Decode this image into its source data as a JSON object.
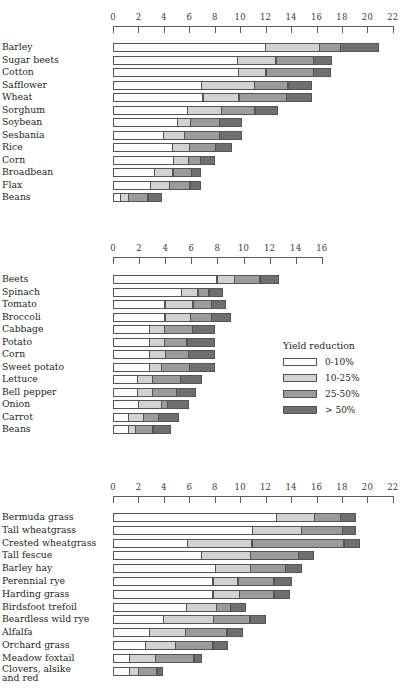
{
  "legend": {
    "title": "Yield reduction",
    "items": [
      {
        "label": "0-10%",
        "color": "#ffffff",
        "class": "s0"
      },
      {
        "label": "10-25%",
        "color": "#d2d2d2",
        "class": "s1"
      },
      {
        "label": "25-50%",
        "color": "#9b9b9b",
        "class": "s2"
      },
      {
        "label": "> 50%",
        "color": "#6f6f6f",
        "class": "s3"
      }
    ]
  },
  "chart_data": [
    {
      "type": "bar",
      "orientation": "horizontal",
      "stacked": true,
      "title": "",
      "xlabel": "",
      "ylabel": "",
      "xlim": [
        0,
        22
      ],
      "xticks": [
        0,
        2,
        4,
        6,
        8,
        10,
        12,
        14,
        16,
        18,
        20,
        22
      ],
      "grid": false,
      "legend_position": "none",
      "series": [
        {
          "name": "0-10%",
          "color": "#ffffff"
        },
        {
          "name": "10-25%",
          "color": "#d2d2d2"
        },
        {
          "name": "25-50%",
          "color": "#9b9b9b"
        },
        {
          "name": "> 50%",
          "color": "#6f6f6f"
        }
      ],
      "categories": [
        "Barley",
        "Sugar beets",
        "Cotton",
        "Safflower",
        "Wheat",
        "Sorghum",
        "Soybean",
        "Sesbania",
        "Rice",
        "Corn",
        "Broadbean",
        "Flax",
        "Beans"
      ],
      "boundaries": [
        [
          0,
          12.0,
          16.3,
          18.0,
          21.1
        ],
        [
          0,
          9.8,
          12.9,
          15.9,
          17.4
        ],
        [
          0,
          9.9,
          12.1,
          15.9,
          17.3
        ],
        [
          0,
          7.0,
          11.2,
          13.9,
          15.8
        ],
        [
          0,
          7.1,
          10.0,
          13.8,
          15.8
        ],
        [
          0,
          5.9,
          8.6,
          11.3,
          13.1
        ],
        [
          0,
          5.1,
          6.2,
          8.5,
          10.3
        ],
        [
          0,
          4.0,
          5.7,
          8.5,
          10.3
        ],
        [
          0,
          4.7,
          6.1,
          8.2,
          9.5
        ],
        [
          0,
          4.8,
          6.0,
          7.0,
          8.2
        ],
        [
          0,
          3.3,
          4.8,
          6.3,
          7.1
        ],
        [
          0,
          3.0,
          4.5,
          6.2,
          7.1
        ],
        [
          0,
          0.6,
          1.3,
          2.9,
          4.0
        ]
      ]
    },
    {
      "type": "bar",
      "orientation": "horizontal",
      "stacked": true,
      "title": "",
      "xlabel": "",
      "ylabel": "",
      "xlim": [
        0,
        16
      ],
      "xticks": [
        0,
        2,
        4,
        6,
        8,
        10,
        12,
        14,
        16
      ],
      "grid": false,
      "legend_position": "right",
      "series": [
        {
          "name": "0-10%",
          "color": "#ffffff"
        },
        {
          "name": "10-25%",
          "color": "#d2d2d2"
        },
        {
          "name": "25-50%",
          "color": "#9b9b9b"
        },
        {
          "name": "> 50%",
          "color": "#6f6f6f"
        }
      ],
      "categories": [
        "Beets",
        "Spinach",
        "Tomato",
        "Broccoli",
        "Cabbage",
        "Potato",
        "Corn",
        "Sweet potato",
        "Lettuce",
        "Bell pepper",
        "Onion",
        "Carrot",
        "Beans"
      ],
      "boundaries": [
        [
          0,
          8.0,
          9.4,
          11.4,
          12.9
        ],
        [
          0,
          5.3,
          6.6,
          7.5,
          8.6
        ],
        [
          0,
          4.0,
          6.2,
          7.7,
          8.8
        ],
        [
          0,
          4.0,
          6.0,
          7.7,
          9.2
        ],
        [
          0,
          2.8,
          4.0,
          6.2,
          8.0
        ],
        [
          0,
          2.8,
          4.0,
          5.8,
          8.0
        ],
        [
          0,
          2.8,
          4.1,
          5.9,
          8.0
        ],
        [
          0,
          2.8,
          3.8,
          6.0,
          8.0
        ],
        [
          0,
          1.9,
          3.1,
          5.3,
          7.0
        ],
        [
          0,
          1.9,
          3.1,
          5.0,
          6.5
        ],
        [
          0,
          2.0,
          3.8,
          4.3,
          6.0
        ],
        [
          0,
          1.2,
          2.4,
          3.6,
          5.2
        ],
        [
          0,
          1.2,
          1.8,
          3.2,
          4.6
        ]
      ]
    },
    {
      "type": "bar",
      "orientation": "horizontal",
      "stacked": true,
      "title": "",
      "xlabel": "",
      "ylabel": "",
      "xlim": [
        0,
        22
      ],
      "xticks": [
        0,
        2,
        4,
        6,
        8,
        10,
        12,
        14,
        16,
        18,
        20,
        22
      ],
      "grid": false,
      "legend_position": "none",
      "series": [
        {
          "name": "0-10%",
          "color": "#ffffff"
        },
        {
          "name": "10-25%",
          "color": "#d2d2d2"
        },
        {
          "name": "25-50%",
          "color": "#9b9b9b"
        },
        {
          "name": "> 50%",
          "color": "#6f6f6f"
        }
      ],
      "categories": [
        "Bermuda grass",
        "Tall wheatgrass",
        "Crested wheatgrass",
        "Tall fescue",
        "Barley hay",
        "Perennial rye",
        "Harding grass",
        "Birdsfoot trefoil",
        "Beardless wild rye",
        "Alfalfa",
        "Orchard grass",
        "Meadow foxtail",
        "Clovers, alsike\nand red"
      ],
      "boundaries": [
        [
          0,
          12.9,
          15.9,
          18.0,
          19.3
        ],
        [
          0,
          11.0,
          14.9,
          18.2,
          19.3
        ],
        [
          0,
          5.9,
          11.0,
          18.3,
          19.6
        ],
        [
          0,
          7.0,
          10.9,
          14.7,
          16.0
        ],
        [
          0,
          8.1,
          10.9,
          13.7,
          15.0
        ],
        [
          0,
          7.9,
          9.9,
          12.8,
          14.2
        ],
        [
          0,
          7.9,
          10.0,
          12.8,
          14.1
        ],
        [
          0,
          5.8,
          8.2,
          9.4,
          10.6
        ],
        [
          0,
          4.0,
          8.0,
          10.9,
          12.2
        ],
        [
          0,
          2.9,
          5.8,
          9.1,
          10.4
        ],
        [
          0,
          2.6,
          5.0,
          8.0,
          9.2
        ],
        [
          0,
          1.3,
          3.4,
          6.5,
          7.2
        ],
        [
          0,
          1.3,
          2.1,
          3.6,
          4.1
        ]
      ]
    }
  ],
  "panels": [
    {
      "top": 10,
      "axis_y": 12,
      "rows_y": 42,
      "row_h": 12.5,
      "x0": 113,
      "px_per_unit": 12.72
    },
    {
      "top": 240,
      "axis_y": 243,
      "rows_y": 274,
      "row_h": 12.5,
      "x0": 113,
      "px_per_unit": 13.05
    },
    {
      "top": 480,
      "axis_y": 482,
      "rows_y": 512,
      "row_h": 12.8,
      "x0": 113,
      "px_per_unit": 12.72
    }
  ],
  "legend_box": {
    "left": 283,
    "top": 340
  }
}
